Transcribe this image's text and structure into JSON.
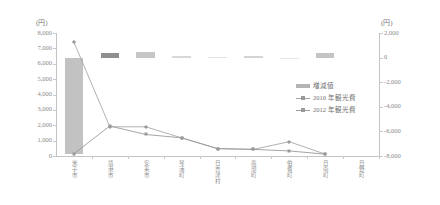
{
  "axes": {
    "left_unit": "(円)",
    "right_unit": "(円)",
    "left_ticks": [
      "8,000",
      "7,000",
      "6,000",
      "5,000",
      "4,000",
      "3,000",
      "2,000",
      "1,000",
      "0"
    ],
    "right_ticks": [
      "2,000",
      "0",
      "-2,000",
      "-4,000",
      "-6,000",
      "-8,000"
    ]
  },
  "legend": {
    "items": [
      {
        "label": "増減値",
        "marker": "bar-swatch",
        "color": "#b4b4b4"
      },
      {
        "label": "2010 年観光費",
        "marker": "line-diamond",
        "color": "#a5a5a5"
      },
      {
        "label": "2012 年観光費",
        "marker": "line-square",
        "color": "#9a9a9a"
      }
    ]
  },
  "chart_data": {
    "type": "bar",
    "title": "",
    "xlabel": "",
    "ylabel": "(円)",
    "y2label": "(円)",
    "ylim": [
      0,
      8000
    ],
    "y2lim": [
      -8000,
      2000
    ],
    "grid": false,
    "legend_position": "right",
    "categories": [
      "米子市",
      "境港市",
      "安来市",
      "琴浦町",
      "日吉津村",
      "南部町",
      "伯耆町",
      "日南町"
    ],
    "categories_display": [
      "米子市",
      "境港市",
      "安来市",
      "琴浦町",
      "日吉津村",
      "南部町",
      "伯耆町",
      "日南町",
      "日野町"
    ],
    "series": [
      {
        "name": "増減値",
        "axis": "right",
        "type": "bar",
        "values": [
          -7850,
          380,
          420,
          120,
          60,
          110,
          0,
          350
        ]
      },
      {
        "name": "2010 年観光費",
        "axis": "left",
        "type": "line",
        "values": [
          7400,
          1900,
          1900,
          1180,
          480,
          430,
          930,
          120
        ]
      },
      {
        "name": "2012 年観光費",
        "axis": "left",
        "type": "line",
        "values": [
          150,
          1950,
          1400,
          1180,
          480,
          430,
          330,
          120
        ]
      }
    ]
  }
}
